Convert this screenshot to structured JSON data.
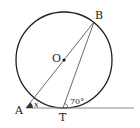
{
  "diagram": {
    "type": "geometry-circle-tangent",
    "points": {
      "A": {
        "label": "A"
      },
      "B": {
        "label": "B"
      },
      "O": {
        "label": "O"
      },
      "T": {
        "label": "T"
      }
    },
    "angles": {
      "at_A": {
        "label": "x",
        "filled": true
      },
      "at_T": {
        "label": "70°"
      }
    },
    "colors": {
      "stroke": "#222222",
      "tangent_line": "#888888",
      "angle_fill": "#333333"
    }
  }
}
